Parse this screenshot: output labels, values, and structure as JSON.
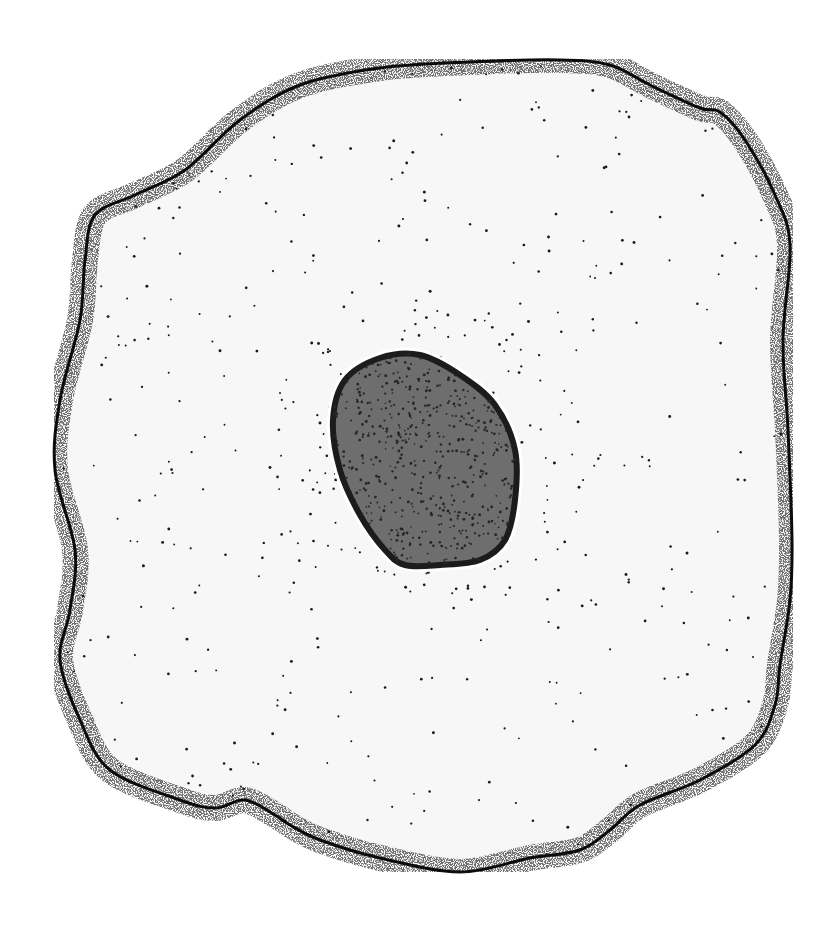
{
  "figure": {
    "colors": {
      "background": "#ffffff",
      "cytoplasm": "#f7f7f7",
      "membrane": "#111111",
      "stipple": "#1a1a1a",
      "nucleus": "#6e6e6e",
      "nucleus_edge": "#1c1c1c",
      "nucleus_halo": "#ffffff"
    },
    "cell_outline": [
      [
        95,
        215
      ],
      [
        135,
        195
      ],
      [
        185,
        170
      ],
      [
        240,
        120
      ],
      [
        300,
        85
      ],
      [
        380,
        68
      ],
      [
        470,
        62
      ],
      [
        560,
        60
      ],
      [
        610,
        65
      ],
      [
        650,
        85
      ],
      [
        700,
        108
      ],
      [
        720,
        112
      ],
      [
        745,
        140
      ],
      [
        775,
        195
      ],
      [
        790,
        245
      ],
      [
        783,
        340
      ],
      [
        788,
        430
      ],
      [
        792,
        540
      ],
      [
        790,
        600
      ],
      [
        780,
        665
      ],
      [
        775,
        705
      ],
      [
        755,
        745
      ],
      [
        700,
        780
      ],
      [
        640,
        805
      ],
      [
        610,
        830
      ],
      [
        580,
        850
      ],
      [
        530,
        858
      ],
      [
        460,
        872
      ],
      [
        380,
        858
      ],
      [
        320,
        840
      ],
      [
        290,
        825
      ],
      [
        275,
        815
      ],
      [
        245,
        800
      ],
      [
        215,
        808
      ],
      [
        180,
        800
      ],
      [
        110,
        770
      ],
      [
        80,
        720
      ],
      [
        60,
        660
      ],
      [
        70,
        610
      ],
      [
        75,
        550
      ],
      [
        55,
        470
      ],
      [
        60,
        400
      ],
      [
        80,
        320
      ],
      [
        85,
        260
      ]
    ],
    "nucleus": {
      "cx": 425,
      "cy": 460,
      "outline": [
        [
          345,
          380
        ],
        [
          380,
          358
        ],
        [
          420,
          355
        ],
        [
          460,
          375
        ],
        [
          495,
          405
        ],
        [
          515,
          450
        ],
        [
          515,
          500
        ],
        [
          505,
          540
        ],
        [
          480,
          560
        ],
        [
          440,
          565
        ],
        [
          405,
          565
        ],
        [
          385,
          550
        ],
        [
          360,
          515
        ],
        [
          340,
          470
        ],
        [
          333,
          420
        ]
      ]
    }
  }
}
